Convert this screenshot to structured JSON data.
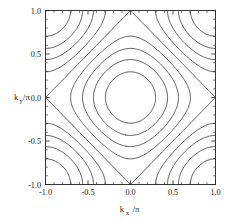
{
  "figure": {
    "background_color": "#ffffff",
    "line_color": "#3a3a3a",
    "axis_color": "#222222"
  },
  "axes": {
    "x_title_main": "k",
    "x_title_sub": "x",
    "x_title_tail": "/π",
    "y_title_main": "k",
    "y_title_sub": "y",
    "y_title_tail": "/π",
    "x_ticks": [
      "-1.0",
      "-0.5",
      "0.0",
      "0.5",
      "1.0"
    ],
    "y_ticks": [
      "1.0",
      "0.5",
      "0.0",
      "-0.5",
      "-1.0"
    ]
  },
  "chart_data": {
    "type": "line",
    "subtype": "contour",
    "title": "",
    "xlabel": "k_x/π",
    "ylabel": "k_y/π",
    "xlim": [
      -1.0,
      1.0
    ],
    "ylim": [
      -1.0,
      1.0
    ],
    "xticks": [
      -1.0,
      -0.5,
      0.0,
      0.5,
      1.0
    ],
    "yticks": [
      -1.0,
      -0.5,
      0.0,
      0.5,
      1.0
    ],
    "xticklabels": [
      "-1.0",
      "-0.5",
      "0.0",
      "0.5",
      "1.0"
    ],
    "yticklabels": [
      "-1.0",
      "-0.5",
      "0.0",
      "0.5",
      "1.0"
    ],
    "minor_ticks_per_interval": 5,
    "tick_direction": "in",
    "ticks_all_sides": true,
    "grid": false,
    "legend": false,
    "legend_position": "none",
    "function": "eps(kx,ky) = -(cos(pi*x) + cos(pi*y))",
    "contour_levels": [
      -1.6,
      -1.2,
      -0.8,
      -0.4,
      0.0,
      0.4,
      0.8,
      1.2,
      1.6
    ],
    "level_count": 9,
    "saddle_points": [
      [
        -1.0,
        0.0
      ],
      [
        1.0,
        0.0
      ],
      [
        0.0,
        -1.0
      ],
      [
        0.0,
        1.0
      ]
    ],
    "closed_contour_x_intercepts": [
      0.205,
      0.4,
      0.585,
      0.755
    ],
    "closed_contour_y_intercepts": [
      0.205,
      0.4,
      0.585,
      0.755
    ],
    "separatrix_level": 0.0,
    "series": [
      {
        "name": "level -1.6",
        "value": -1.6,
        "closed": true,
        "x_intercept": 0.205
      },
      {
        "name": "level -1.2",
        "value": -1.2,
        "closed": true,
        "x_intercept": 0.4
      },
      {
        "name": "level -0.8",
        "value": -0.8,
        "closed": true,
        "x_intercept": 0.585
      },
      {
        "name": "level -0.4",
        "value": -0.4,
        "closed": true,
        "x_intercept": 0.755
      },
      {
        "name": "level 0.0",
        "value": 0.0,
        "closed": false,
        "x_intercept": 1.0
      },
      {
        "name": "level 0.4",
        "value": 0.4,
        "closed": false,
        "x_intercept": 1.0
      },
      {
        "name": "level 0.8",
        "value": 0.8,
        "closed": false,
        "x_intercept": 1.0
      },
      {
        "name": "level 1.2",
        "value": 1.2,
        "closed": false,
        "x_intercept": 1.0
      },
      {
        "name": "level 1.6",
        "value": 1.6,
        "closed": false,
        "x_intercept": 1.0
      }
    ]
  }
}
